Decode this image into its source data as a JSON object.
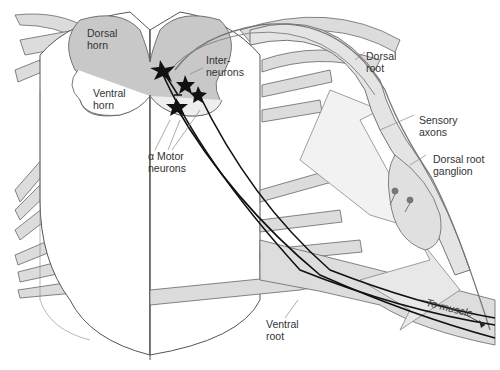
{
  "colors": {
    "background": "#ffffff",
    "cord_fill": "#ffffff",
    "gray_matter": "#c8c8c8",
    "nerve_fill": "#d9d9d9",
    "outline": "#555555",
    "neuron": "#111111",
    "sensory_cell": "#777777"
  },
  "labels": {
    "dorsal_horn": {
      "line1": "Dorsal",
      "line2": "horn"
    },
    "ventral_horn": {
      "line1": "Ventral",
      "line2": "horn"
    },
    "interneurons": {
      "line1": "Inter-",
      "line2": "neurons"
    },
    "alpha_motor_neurons": {
      "line1": "α Motor",
      "line2": "neurons"
    },
    "dorsal_root": {
      "line1": "Dorsal",
      "line2": "root"
    },
    "sensory_axons": {
      "line1": "Sensory",
      "line2": "axons"
    },
    "dorsal_root_ganglion": {
      "line1": "Dorsal root",
      "line2": "ganglion"
    },
    "ventral_root": {
      "line1": "Ventral",
      "line2": "root"
    },
    "to_muscle": "To muscle"
  },
  "neuron_glyphs": [
    "Ia",
    "Ib"
  ]
}
